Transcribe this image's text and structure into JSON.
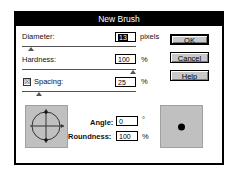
{
  "dialog": {
    "title": "New Brush",
    "fields": {
      "diameter": {
        "label": "Diameter:",
        "value": "13",
        "unit": "pixels"
      },
      "hardness": {
        "label": "Hardness:",
        "value": "100",
        "unit": "%"
      },
      "spacing": {
        "label": "Spacing:",
        "value": "25",
        "unit": "%",
        "checked": true,
        "check_glyph": "☒"
      },
      "angle": {
        "label": "Angle:",
        "value": "0",
        "unit": "°"
      },
      "roundness": {
        "label": "Roundness:",
        "value": "100",
        "unit": "%"
      }
    },
    "buttons": {
      "ok": "OK",
      "cancel": "Cancel",
      "help": "Help"
    },
    "colors": {
      "titlebar": "#000000",
      "button_face": "#c8c8c8",
      "preview_bg": "#c0c0c0"
    }
  }
}
